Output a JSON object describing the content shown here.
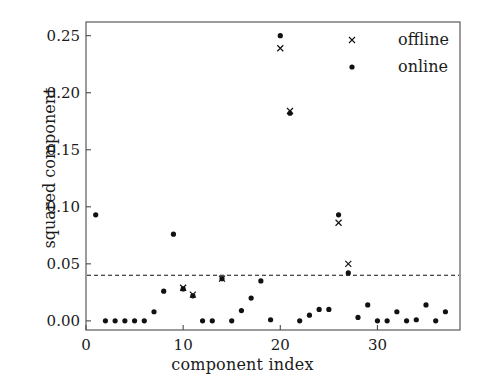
{
  "chart_data": {
    "type": "scatter",
    "title": "",
    "xlabel": "component index",
    "ylabel": "squared component",
    "xlim": [
      0,
      38.5
    ],
    "ylim": [
      -0.008,
      0.262
    ],
    "xticks": [
      0,
      10,
      20,
      30
    ],
    "xticklabels": [
      "0",
      "10",
      "20",
      "30"
    ],
    "yticks": [
      0.0,
      0.05,
      0.1,
      0.15,
      0.2,
      0.25
    ],
    "yticklabels": [
      "0.00",
      "0.05",
      "0.10",
      "0.15",
      "0.20",
      "0.25"
    ],
    "grid": false,
    "legend_position": "upper right",
    "threshold": {
      "value": 0.04,
      "style": "dashed",
      "color": "#111111",
      "label": ""
    },
    "series": [
      {
        "name": "offline",
        "marker": "x",
        "color": "#111111",
        "x": [
          10,
          11,
          14,
          20,
          21,
          26,
          27
        ],
        "y": [
          0.029,
          0.023,
          0.037,
          0.239,
          0.184,
          0.086,
          0.05
        ]
      },
      {
        "name": "online",
        "marker": "dot",
        "color": "#111111",
        "x": [
          1,
          2,
          3,
          4,
          5,
          6,
          7,
          8,
          9,
          10,
          11,
          12,
          13,
          14,
          15,
          16,
          17,
          18,
          19,
          20,
          21,
          22,
          23,
          24,
          25,
          26,
          27,
          28,
          29,
          30,
          31,
          32,
          33,
          34,
          35,
          36,
          37
        ],
        "y": [
          0.093,
          0.0,
          0.0,
          0.0,
          0.0,
          0.0,
          0.008,
          0.026,
          0.076,
          0.028,
          0.022,
          0.0,
          0.0,
          0.037,
          0.0,
          0.009,
          0.02,
          0.035,
          0.001,
          0.25,
          0.182,
          0.0,
          0.005,
          0.01,
          0.01,
          0.093,
          0.042,
          0.003,
          0.014,
          0.0,
          0.0,
          0.008,
          0.0,
          0.001,
          0.014,
          0.0,
          0.008
        ]
      }
    ],
    "legend_entries": [
      {
        "label": "offline",
        "marker": "x"
      },
      {
        "label": "online",
        "marker": "dot"
      }
    ]
  },
  "axes": {
    "frame_color": "#4a4a4a"
  }
}
